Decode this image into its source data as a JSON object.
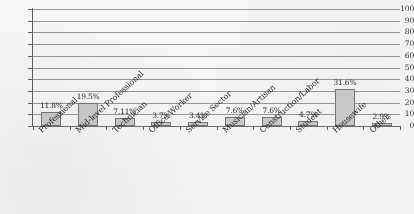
{
  "chart_data": {
    "type": "bar",
    "title": "",
    "xlabel": "",
    "ylabel": "",
    "ylim": [
      0,
      100
    ],
    "ytick_step": 10,
    "yticks": [
      "100",
      "90",
      "80",
      "70",
      "60",
      "50",
      "40",
      "30",
      "20",
      "10",
      "0"
    ],
    "grid": true,
    "legend": "none",
    "categories": [
      "Professional",
      "Mid-level Professional",
      "Technician",
      "Office Worker",
      "Service Sector",
      "Musician/Artisan",
      "Construction/Labor",
      "Student",
      "Housewife",
      "Other"
    ],
    "values": [
      11.8,
      19.5,
      7.11,
      3.7,
      3.4,
      7.6,
      7.6,
      4.7,
      31.6,
      2.9
    ],
    "data_labels": [
      "11.8%",
      "19.5%",
      "7.11%",
      "3.7%",
      "3.4%",
      "7.6%",
      "7.6%",
      "4.7%",
      "31.6%",
      "2.9%"
    ],
    "bar_fill": "#cfcfcd",
    "bar_stroke": "#767674",
    "gridline_color": "#9a9a98",
    "axis_color": "#5e5e5c",
    "background": "#fbfbfa"
  }
}
